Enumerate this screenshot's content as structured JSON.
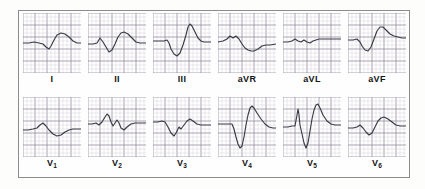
{
  "figure": {
    "kind": "ecg-12-lead",
    "background_color": "#fdfdfc",
    "frame_color": "#8c8c8c",
    "trace_color": "#3a3a45",
    "grid_minor_color": "#c9c6cf",
    "grid_major_color": "#8e8a99",
    "grid_minor_px": 4.0,
    "grid_major_px": 12.0,
    "rows": 2,
    "columns": 6
  },
  "chart_data": {
    "type": "line",
    "xlabel": "",
    "ylabel": "",
    "grid": true,
    "legend_position": "none",
    "axis_note": "ECG graph paper: small square = 0.04 s x 0.1 mV; large square = 0.20 s x 0.5 mV",
    "panel_rows": [
      {
        "row_name": "limb-leads",
        "leads": [
          "I",
          "II",
          "III",
          "aVR",
          "aVL",
          "aVF"
        ]
      },
      {
        "row_name": "precordial-leads",
        "leads": [
          "V1",
          "V2",
          "V3",
          "V4",
          "V5",
          "V6"
        ]
      }
    ],
    "series": [
      {
        "name": "I",
        "label": "I",
        "label_html": "I",
        "row": 0,
        "column": 0,
        "description": "Flat baseline, small narrow q/s dip then broad rounded R-T hump",
        "baseline_y": 30,
        "points": "0,30 6,30 11,29 16,30 20,31 23,34 26,36 28,33 31,27 34,22 38,20 42,21 46,24 50,28 54,30 58,30"
      },
      {
        "name": "II",
        "label": "II",
        "label_html": "II",
        "row": 0,
        "column": 1,
        "description": "Small initial notch, then rS followed by tall broad rounded R-T complex",
        "baseline_y": 30,
        "points": "0,31 5,31 9,30 12,25 15,29 18,34 21,39 24,37 27,31 30,24 33,20 36,19 40,21 44,25 48,29 52,30 58,30"
      },
      {
        "name": "III",
        "label": "III",
        "label_html": "III",
        "row": 0,
        "column": 2,
        "description": "Small r, deep wide S (QS-like), then very tall peaked R, return to baseline",
        "baseline_y": 28,
        "points": "0,28 6,28 11,28 14,27 16,30 18,36 21,41 24,43 27,40 30,32 33,22 35,14 37,11 39,13 42,19 45,25 48,28 51,29 55,29 58,29"
      },
      {
        "name": "aVR",
        "label": "aVR",
        "label_html": "aVR",
        "row": 0,
        "column": 3,
        "description": "Small biphasic notch then predominantly negative broad deflection with slow return",
        "baseline_y": 27,
        "points": "0,29 5,28 9,26 12,23 15,25 18,23 21,26 24,31 27,35 30,37 33,38 36,38 40,36 44,33 48,32 52,32 58,31"
      },
      {
        "name": "aVL",
        "label": "aVL",
        "label_html": "aVL",
        "row": 0,
        "column": 4,
        "description": "Nearly isoelectric, low amplitude notched complex on a flat line",
        "baseline_y": 27,
        "points": "0,29 5,29 9,28 12,26 15,28 18,29 21,27 24,29 27,30 30,28 33,27 36,26 40,26 44,26 48,26 52,26 58,26"
      },
      {
        "name": "aVF",
        "label": "aVF",
        "label_html": "aVF",
        "row": 0,
        "column": 5,
        "description": "Small r, deep S, then tall rounded R-T hump",
        "baseline_y": 27,
        "points": "0,27 5,27 9,26 12,29 14,33 17,37 20,38 23,34 26,26 29,18 32,14 35,14 38,17 42,21 46,23 50,24 54,25 58,25"
      },
      {
        "name": "V1",
        "label": "V1",
        "label_html": "V<sub>1</sub>",
        "row": 1,
        "column": 0,
        "description": "Low amplitude: small r then shallow broad negative S-T wave",
        "baseline_y": 31,
        "points": "0,33 5,33 10,32 14,31 17,28 20,26 23,29 26,33 30,37 34,39 38,38 42,35 46,33 50,32 54,32 58,32"
      },
      {
        "name": "V2",
        "label": "V2",
        "label_html": "V<sub>2</sub>",
        "row": 1,
        "column": 1,
        "description": "rSr' pattern: notched complex with taller second peak then S then flat",
        "baseline_y": 26,
        "points": "0,27 4,27 8,26 11,28 14,25 17,20 19,17 21,19 23,25 25,29 27,26 29,23 31,26 33,31 36,33 39,30 43,27 47,26 52,26 58,26"
      },
      {
        "name": "V3",
        "label": "V3",
        "label_html": "V<sub>3</sub>",
        "row": 1,
        "column": 2,
        "description": "Small r, deep S, then notched positive T hump returning to baseline",
        "baseline_y": 25,
        "points": "0,25 5,25 9,24 12,25 15,30 18,36 21,39 23,36 26,30 28,32 31,28 34,24 37,22 40,24 44,27 48,28 52,28 58,28"
      },
      {
        "name": "V4",
        "label": "V4",
        "label_html": "V<sub>4</sub>",
        "row": 1,
        "column": 3,
        "description": "Flat segment, very deep S wave then extremely tall R peak with slow descent",
        "baseline_y": 27,
        "points": "0,27 6,27 11,27 14,27 16,32 18,40 20,47 22,51 24,49 26,40 28,28 30,18 32,11 34,9 36,11 39,16 43,22 47,27 51,30 55,31 58,31"
      },
      {
        "name": "V5",
        "label": "V5",
        "label_html": "V<sub>5</sub>",
        "row": 1,
        "column": 4,
        "description": "Narrow tall spike, deep S wave, then very tall peaked R with slow decline",
        "baseline_y": 28,
        "points": "0,30 5,30 9,29 12,29 14,18 15,12 16,18 17,28 19,37 21,46 23,51 25,46 27,34 29,22 31,13 33,8 35,7 37,11 40,18 44,24 48,27 52,28 58,28"
      },
      {
        "name": "V6",
        "label": "V6",
        "label_html": "V<sub>6</sub>",
        "row": 1,
        "column": 5,
        "description": "Small notch, small s, then broad rounded positive T hump",
        "baseline_y": 29,
        "points": "0,31 5,31 9,30 12,28 15,31 18,35 21,38 24,36 27,30 30,24 33,21 36,20 40,22 44,25 48,28 52,29 58,29"
      }
    ]
  }
}
